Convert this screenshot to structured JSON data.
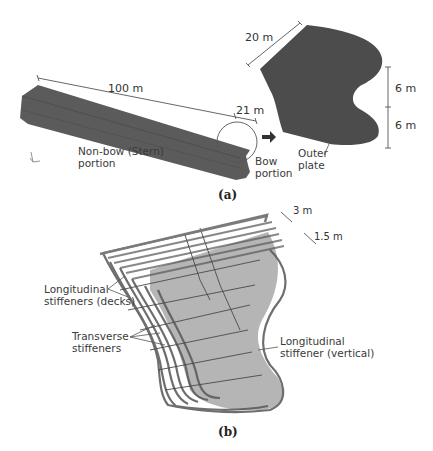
{
  "panel_a": {
    "caption": "(a)",
    "hull": {
      "length_label": "100 m",
      "bow_length_label": "21 m",
      "stern_label_line1": "Non-bow (Stern)",
      "stern_label_line2": "portion",
      "bow_label_line1": "Bow",
      "bow_label_line2": "portion"
    },
    "bow_detail": {
      "width_label": "20 m",
      "height_upper_label": "6 m",
      "height_lower_label": "6 m",
      "plate_label_line1": "Outer",
      "plate_label_line2": "plate"
    },
    "colors": {
      "hull": "#5a5a5a",
      "hull_edge": "#444444",
      "bow": "#4a4a4a"
    }
  },
  "panel_b": {
    "caption": "(b)",
    "spacing_outer_label": "3 m",
    "spacing_inner_label": "1.5 m",
    "labels": {
      "long_decks_line1": "Longitudinal",
      "long_decks_line2": "stiffeners (decks)",
      "transverse_line1": "Transverse",
      "transverse_line2": "stiffeners",
      "long_vertical_line1": "Longitudinal",
      "long_vertical_line2": "stiffener (vertical)"
    },
    "colors": {
      "frame": "#777777",
      "frame_dark": "#3a3a3a"
    }
  }
}
